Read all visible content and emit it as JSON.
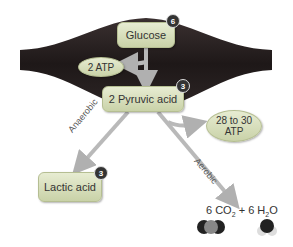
{
  "diagram": {
    "nodes": {
      "glucose": {
        "label": "Glucose",
        "badge": "6"
      },
      "atp2": {
        "label": "2 ATP"
      },
      "pyruvic": {
        "label": "2 Pyruvic acid",
        "badge": "3"
      },
      "atp28": {
        "line1": "28 to 30",
        "line2": "ATP"
      },
      "lactic": {
        "label": "Lactic acid",
        "badge": "3"
      }
    },
    "edges": {
      "anaerobic": "Anaerobic",
      "aerobic": "Aerobic"
    },
    "products": {
      "co2_coef": "6 CO",
      "co2_sub": "2",
      "plus": " + ",
      "h2o_coef": "6 H",
      "h2o_sub": "2",
      "h2o_tail": "O"
    },
    "colors": {
      "muscle": "#2a2222",
      "box": "#d8dfbd",
      "arrow": "#b9b9b9"
    }
  }
}
